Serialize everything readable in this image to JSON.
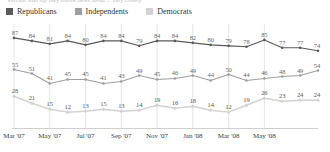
{
  "title_clipped": "Percent who say they follow news about ... very closely",
  "legend": {
    "items": [
      {
        "label": "Republicans",
        "color": "#5b5b5b"
      },
      {
        "label": "Independents",
        "color": "#9e9e9e"
      },
      {
        "label": "Democrats",
        "color": "#d2d2d2"
      }
    ]
  },
  "chart_data": {
    "type": "line",
    "title": "",
    "xlabel": "",
    "ylabel": "",
    "ylim": [
      0,
      95
    ],
    "grid": "vertical",
    "legend_position": "top-left",
    "x": [
      "Mar '07",
      "Apr '07",
      "May '07",
      "Jun '07",
      "Jul '07",
      "Aug '07",
      "Sep '07",
      "Oct '07",
      "Nov '07",
      "Dec '07",
      "Jan '08",
      "Feb '08",
      "Mar '08",
      "Apr '08",
      "May '08",
      "Jun '08",
      "Jul '08",
      "Aug '08"
    ],
    "tick_labels": [
      "Mar '07",
      "May '07",
      "Jul '07",
      "Sep '07",
      "Nov '07",
      "Jan '08",
      "Mar '08",
      "May '08"
    ],
    "tick_indices": [
      0,
      2,
      4,
      6,
      8,
      10,
      12,
      14
    ],
    "series": [
      {
        "name": "Republicans",
        "color": "#5b5b5b",
        "values": [
          87,
          84,
          81,
          84,
          80,
          84,
          84,
          79,
          84,
          84,
          82,
          80,
          79,
          78,
          85,
          77,
          77,
          74
        ]
      },
      {
        "name": "Independents",
        "color": "#9e9e9e",
        "values": [
          55,
          51,
          41,
          45,
          45,
          41,
          43,
          49,
          45,
          46,
          49,
          44,
          50,
          44,
          46,
          48,
          49,
          54
        ]
      },
      {
        "name": "Democrats",
        "color": "#d2d2d2",
        "values": [
          28,
          21,
          15,
          12,
          13,
          15,
          13,
          14,
          19,
          16,
          18,
          14,
          12,
          19,
          26,
          23,
          24,
          24
        ]
      }
    ]
  }
}
